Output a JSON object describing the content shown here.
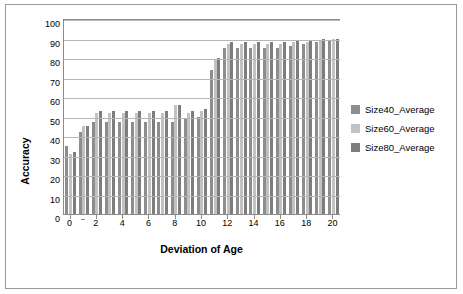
{
  "chart_data": {
    "type": "bar",
    "title": "",
    "xlabel": "Deviation of Age",
    "ylabel": "Accuracy",
    "ylim": [
      0,
      100
    ],
    "ytick_step": 10,
    "yticks": [
      0,
      10,
      20,
      30,
      40,
      50,
      60,
      70,
      80,
      90,
      100
    ],
    "grid": true,
    "legend_position": "right",
    "categories": [
      0,
      1,
      2,
      3,
      4,
      5,
      6,
      7,
      8,
      9,
      10,
      11,
      12,
      13,
      14,
      15,
      16,
      17,
      18,
      19,
      20
    ],
    "xtick_labels": [
      "0",
      "2",
      "4",
      "6",
      "8",
      "10",
      "12",
      "14",
      "16",
      "18",
      "20"
    ],
    "series": [
      {
        "name": "Size40_Average",
        "color": "#8d8d8d",
        "values": [
          35,
          42,
          47,
          47,
          47,
          47,
          47,
          47,
          47,
          49,
          50,
          74,
          85,
          85,
          85,
          85,
          85,
          86,
          87,
          88,
          89
        ]
      },
      {
        "name": "Size60_Average",
        "color": "#c2c2c2",
        "values": [
          31,
          45,
          52,
          52,
          52,
          52,
          52,
          52,
          56,
          52,
          53,
          79,
          87,
          87,
          87,
          87,
          87,
          88,
          88,
          89,
          90
        ]
      },
      {
        "name": "Size80_Average",
        "color": "#7d7d7d",
        "values": [
          32,
          45,
          53,
          53,
          53,
          53,
          53,
          53,
          56,
          53,
          54,
          80,
          88,
          88,
          88,
          88,
          88,
          89,
          89,
          90,
          90
        ]
      }
    ]
  },
  "legend": {
    "items": [
      {
        "label": "Size40_Average",
        "color": "#8d8d8d"
      },
      {
        "label": "Size60_Average",
        "color": "#c2c2c2"
      },
      {
        "label": "Size80_Average",
        "color": "#7d7d7d"
      }
    ]
  }
}
